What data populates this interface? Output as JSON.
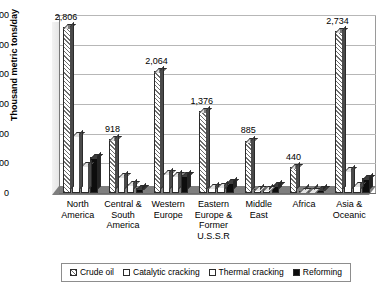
{
  "chart_data": {
    "type": "bar",
    "title": "",
    "xlabel": "",
    "ylabel": "Thousand metric tons/day",
    "ylim": [
      0,
      3000
    ],
    "ytick_labels": [
      "0",
      "500",
      "1,000",
      "1,500",
      "2,000",
      "2,500",
      "3,000"
    ],
    "ytick_values": [
      0,
      500,
      1000,
      1500,
      2000,
      2500,
      3000
    ],
    "grid": true,
    "legend_position": "bottom",
    "categories": [
      "North America",
      "Central & South America",
      "Western Europe",
      "Eastern Europe & Former U.S.S.R",
      "Middle East",
      "Africa",
      "Asia & Oceanic"
    ],
    "category_lines": [
      [
        "North",
        "America"
      ],
      [
        "Central &",
        "South",
        "America"
      ],
      [
        "Western",
        "Europe"
      ],
      [
        "Eastern",
        "Europe &",
        "Former",
        "U.S.S.R"
      ],
      [
        "Middle",
        "East"
      ],
      [
        "Africa"
      ],
      [
        "Asia &",
        "Oceanic"
      ]
    ],
    "series": [
      {
        "name": "Crude oil",
        "values": [
          2806,
          918,
          2064,
          1376,
          885,
          440,
          2734
        ]
      },
      {
        "name": "Catalytic cracking",
        "values": [
          970,
          290,
          330,
          100,
          70,
          40,
          380
        ]
      },
      {
        "name": "Thermal cracking",
        "values": [
          470,
          150,
          300,
          120,
          60,
          30,
          130
        ]
      },
      {
        "name": "Reforming",
        "values": [
          600,
          90,
          310,
          190,
          130,
          75,
          250
        ]
      }
    ],
    "data_labels": [
      {
        "category": "North America",
        "value": "2,806"
      },
      {
        "category": "Central & South America",
        "value": "918"
      },
      {
        "category": "Western Europe",
        "value": "2,064"
      },
      {
        "category": "Eastern Europe & Former U.S.S.R",
        "value": "1,376"
      },
      {
        "category": "Middle East",
        "value": "885"
      },
      {
        "category": "Africa",
        "value": "440"
      },
      {
        "category": "Asia & Oceanic",
        "value": "2,734"
      }
    ],
    "legend_entries": [
      "Crude oil",
      "Catalytic cracking",
      "Thermal cracking",
      "Reforming"
    ]
  }
}
